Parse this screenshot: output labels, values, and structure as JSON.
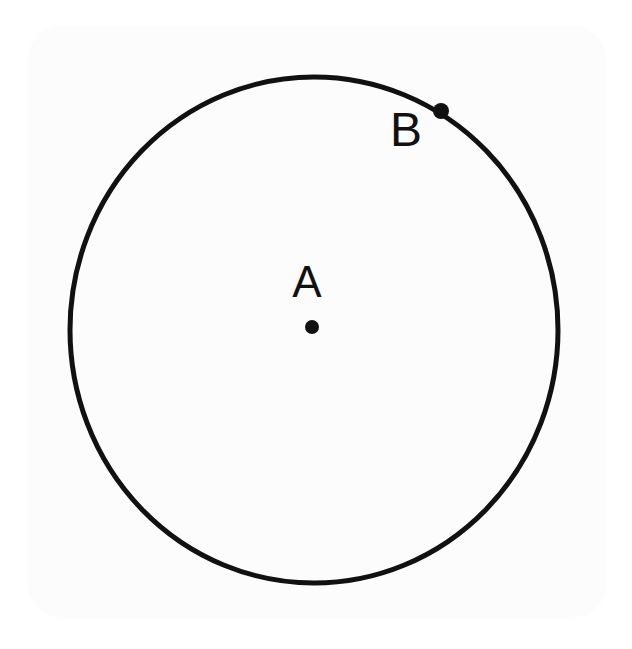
{
  "figure": {
    "background_color": "#ffffff",
    "card_color": "#fcfcfc",
    "ink_color": "#111111",
    "labels": {
      "center_label": "A",
      "point_label": "B"
    },
    "shapes": {
      "circle": {
        "name": "circle-outline",
        "center_x": 314,
        "center_y": 330,
        "radius_x": 244,
        "radius_y": 253,
        "stroke_width": 5,
        "stroke_color": "#111111",
        "fill": "none"
      },
      "center_point": {
        "name": "center-point-A",
        "x": 312,
        "y": 327,
        "radius": 7,
        "color": "#111111"
      },
      "circumference_point": {
        "name": "circumference-point-B",
        "x": 441,
        "y": 111,
        "radius": 8,
        "color": "#111111"
      }
    },
    "label_positions": {
      "A": {
        "x": 307,
        "y": 297
      },
      "B": {
        "x": 406,
        "y": 146
      }
    }
  },
  "chart_data": {
    "type": "scatter",
    "xlabel": "",
    "ylabel": "",
    "points": [
      {
        "label": "A",
        "role": "center",
        "x": 312,
        "y": 327
      },
      {
        "label": "B",
        "role": "on-circumference",
        "x": 441,
        "y": 111
      }
    ],
    "annotations": [
      "A",
      "B"
    ],
    "grid": false,
    "legend": "none"
  }
}
